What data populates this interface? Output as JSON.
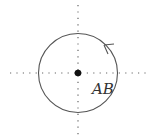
{
  "diagram": {
    "label": "AB",
    "center": {
      "x": 78,
      "y": 73
    },
    "radius": 39,
    "colors": {
      "stroke": "#555555",
      "axis": "#666666",
      "dot": "#111111"
    },
    "arrow_direction": "counterclockwise"
  }
}
